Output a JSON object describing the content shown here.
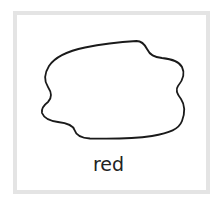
{
  "card": {
    "label": "red",
    "border_color": "#e4e4e4",
    "shape": {
      "type": "irregular-blob-outline",
      "stroke_color": "#1a1a1a",
      "fill": "none"
    }
  }
}
